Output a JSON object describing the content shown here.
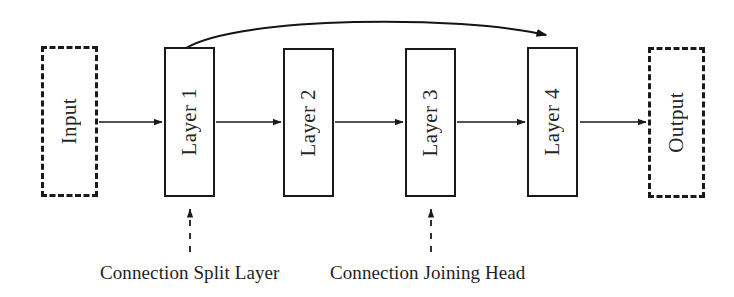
{
  "diagram": {
    "background_color": "#ffffff",
    "line_color": "#1a1a1a",
    "text_color": "#262626",
    "nodes": [
      {
        "id": "input",
        "label": "Input",
        "style": "dashed",
        "x": 41,
        "y": 46,
        "w": 57,
        "h": 151
      },
      {
        "id": "layer1",
        "label": "Layer 1",
        "style": "solid",
        "x": 164,
        "y": 47,
        "w": 51,
        "h": 150
      },
      {
        "id": "layer2",
        "label": "Layer 2",
        "style": "solid",
        "x": 283,
        "y": 48,
        "w": 51,
        "h": 149
      },
      {
        "id": "layer3",
        "label": "Layer 3",
        "style": "solid",
        "x": 405,
        "y": 48,
        "w": 51,
        "h": 149
      },
      {
        "id": "layer4",
        "label": "Layer 4",
        "style": "solid",
        "x": 527,
        "y": 47,
        "w": 51,
        "h": 150
      },
      {
        "id": "output",
        "label": "Output",
        "style": "dashed",
        "x": 648,
        "y": 47,
        "w": 57,
        "h": 151
      }
    ],
    "edges": [
      {
        "id": "input-to-layer1",
        "from": "input",
        "to": "layer1",
        "kind": "straight-arrow"
      },
      {
        "id": "layer1-to-layer2",
        "from": "layer1",
        "to": "layer2",
        "kind": "straight-arrow"
      },
      {
        "id": "layer2-to-layer3",
        "from": "layer2",
        "to": "layer3",
        "kind": "straight-arrow"
      },
      {
        "id": "layer3-to-layer4",
        "from": "layer3",
        "to": "layer4",
        "kind": "straight-arrow"
      },
      {
        "id": "layer4-to-output",
        "from": "layer4",
        "to": "output",
        "kind": "straight-arrow"
      },
      {
        "id": "skip-connection",
        "from": "layer1",
        "to": "layer4",
        "kind": "curved-arrow"
      }
    ],
    "annotations": [
      {
        "id": "split-annotation",
        "label": "Connection Split Layer",
        "points_to": "layer1",
        "arrow_x": 190,
        "text_x": 100,
        "text_y": 262
      },
      {
        "id": "joining-annotation",
        "label": "Connection Joining Head",
        "points_to": "layer3",
        "arrow_x": 431,
        "text_x": 330,
        "text_y": 262
      }
    ]
  }
}
